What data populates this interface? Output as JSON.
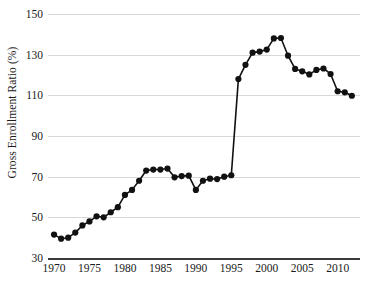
{
  "chart_data": {
    "type": "line",
    "title": "",
    "subtitle": "",
    "xlabel": "",
    "ylabel": "Gross Enrollment Ratio (%)",
    "xlim": [
      1969,
      2013
    ],
    "ylim": [
      30,
      150
    ],
    "grid": true,
    "legend": false,
    "legend_position": "none",
    "marker": "filled-circle",
    "line_color": "#111111",
    "marker_color": "#111111",
    "grid_color": "#d8d8d8",
    "axis_color": "#3a3a3a",
    "background": "#ffffff",
    "y_ticks": [
      30,
      50,
      70,
      90,
      110,
      130,
      150
    ],
    "x_ticks": [
      1970,
      1975,
      1980,
      1985,
      1990,
      1995,
      2000,
      2005,
      2010
    ],
    "x": [
      1970,
      1971,
      1972,
      1973,
      1974,
      1975,
      1976,
      1977,
      1978,
      1979,
      1980,
      1981,
      1982,
      1983,
      1984,
      1985,
      1986,
      1987,
      1988,
      1989,
      1990,
      1991,
      1992,
      1993,
      1994,
      1995,
      1996,
      1997,
      1998,
      1999,
      2000,
      2001,
      2002,
      2003,
      2004,
      2005,
      2006,
      2007,
      2008,
      2009,
      2010,
      2011,
      2012
    ],
    "values": [
      41.5,
      39.5,
      40.0,
      42.5,
      46.0,
      48.0,
      50.5,
      50.0,
      52.5,
      55.0,
      61.0,
      63.5,
      68.0,
      73.0,
      73.5,
      73.5,
      74.0,
      69.7,
      70.3,
      70.5,
      63.5,
      68.0,
      69.0,
      68.8,
      70.0,
      70.7,
      118.0,
      125.0,
      131.0,
      131.5,
      132.5,
      138.0,
      138.2,
      129.5,
      123.0,
      121.8,
      120.3,
      122.5,
      123.2,
      120.5,
      112.0,
      111.5,
      109.8
    ],
    "series": [
      {
        "name": "Gross Enrollment Ratio",
        "values": [
          41.5,
          39.5,
          40.0,
          42.5,
          46.0,
          48.0,
          50.5,
          50.0,
          52.5,
          55.0,
          61.0,
          63.5,
          68.0,
          73.0,
          73.5,
          73.5,
          74.0,
          69.7,
          70.3,
          70.5,
          63.5,
          68.0,
          69.0,
          68.8,
          70.0,
          70.7,
          118.0,
          125.0,
          131.0,
          131.5,
          132.5,
          138.0,
          138.2,
          129.5,
          123.0,
          121.8,
          120.3,
          122.5,
          123.2,
          120.5,
          112.0,
          111.5,
          109.8
        ]
      }
    ],
    "annotations": []
  }
}
